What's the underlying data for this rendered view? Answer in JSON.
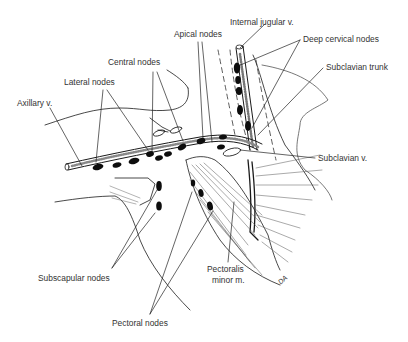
{
  "figure": {
    "type": "anatomical illustration",
    "colors": {
      "ink": "#111111",
      "label": "#333333",
      "background": "#ffffff",
      "node_fill": "#0d0d0d"
    }
  },
  "labels": {
    "internal_jugular": "Internal jugular v.",
    "apical_nodes": "Apical nodes",
    "deep_cervical_nodes": "Deep cervical nodes",
    "central_nodes": "Central nodes",
    "lateral_nodes": "Lateral nodes",
    "subclavian_trunk": "Subclavian trunk",
    "axillary_v": "Axillary v.",
    "subclavian_v": "Subclavian v.",
    "subscapular_nodes": "Subscapular nodes",
    "pectoralis_minor_line1": "Pectoralis",
    "pectoralis_minor_line2": "minor m.",
    "pectoral_nodes": "Pectoral nodes",
    "signature": "DA"
  }
}
